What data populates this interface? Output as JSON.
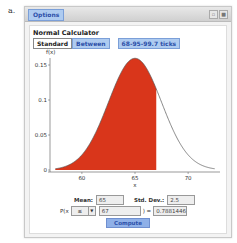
{
  "figure_label": "a.",
  "window": {
    "options_label": "Options",
    "controls": [
      "restore-icon",
      "close-icon"
    ]
  },
  "calculator": {
    "title": "Normal Calculator",
    "tabs": [
      {
        "label": "Standard",
        "active": true
      },
      {
        "label": "Between",
        "active": false
      }
    ],
    "ticks_button": "68-95-99.7 ticks"
  },
  "chart_data": {
    "type": "area",
    "title": "",
    "xlabel": "x",
    "ylabel": "f(x)",
    "xlim": [
      57,
      73
    ],
    "ylim": [
      0,
      0.16
    ],
    "x_ticks": [
      "60",
      "65",
      "70"
    ],
    "y_ticks": [
      "0",
      "0.05",
      "0.1",
      "0.15"
    ],
    "distribution": {
      "mean": 65,
      "sd": 2.5
    },
    "shaded_region": {
      "from": 57.5,
      "to": 67,
      "color": "#d9361b"
    },
    "curve_color": "#555555",
    "grid": false
  },
  "inputs": {
    "mean_label": "Mean:",
    "mean_value": "65",
    "sd_label": "Std. Dev.:",
    "sd_value": "2.5",
    "prob_prefix": "P(x",
    "operator": "≤",
    "x_value": "67",
    "equals": ") =",
    "result": "0.7881446",
    "compute_label": "Compute"
  }
}
